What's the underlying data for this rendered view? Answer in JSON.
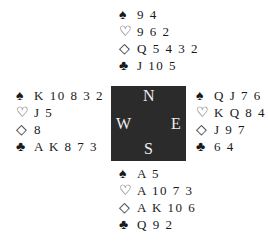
{
  "suit_symbols": {
    "spades": "♠",
    "hearts": "♡",
    "diamonds": "◇",
    "clubs": "♣"
  },
  "compass": {
    "north": "N",
    "south": "S",
    "west": "W",
    "east": "E",
    "background": "#2b2b2b"
  },
  "hands": {
    "north": {
      "spades": "9 4",
      "hearts": "9 6 2",
      "diamonds": "Q 5 4 3 2",
      "clubs": "J 10 5"
    },
    "west": {
      "spades": "K 10 8 3 2",
      "hearts": "J 5",
      "diamonds": "8",
      "clubs": "A K 8 7 3"
    },
    "east": {
      "spades": "Q J 7 6",
      "hearts": "K Q 8 4",
      "diamonds": "J 9 7",
      "clubs": "6 4"
    },
    "south": {
      "spades": "A 5",
      "hearts": "A 10 7 3",
      "diamonds": "A K 10 6",
      "clubs": "Q 9 2"
    }
  }
}
